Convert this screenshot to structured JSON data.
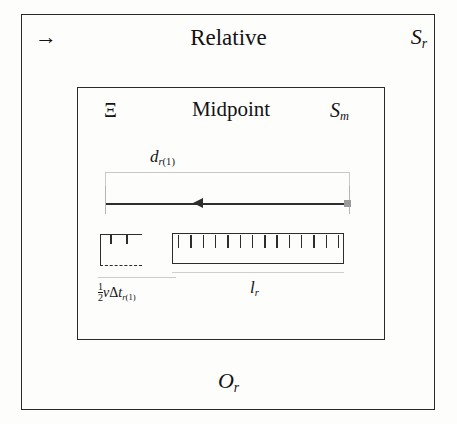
{
  "diagram": {
    "outer_frame": {
      "name": "Relative frame",
      "title": "Relative",
      "corner_label": "S",
      "corner_sub": "r",
      "direction_icon": "→",
      "bottom_label": "O",
      "bottom_sub": "r"
    },
    "inner_frame": {
      "name": "Midpoint frame",
      "title": "Midpoint",
      "corner_label": "S",
      "corner_sub": "m",
      "symbol": "Ξ"
    },
    "measures": {
      "distance": {
        "label": "d",
        "sub": "r",
        "sub_index": "(1)",
        "arrow_direction": "left"
      },
      "light_path": {
        "fraction_numerator": "1",
        "fraction_denominator": "2",
        "nu": "ν",
        "delta": "Δ",
        "t": "t",
        "sub": "r",
        "sub_index": "(1)"
      },
      "rod": {
        "label": "l",
        "sub": "r",
        "tick_count": 14
      }
    }
  },
  "colors": {
    "ink": "#2a2a2a",
    "guide": "#c9c9c9",
    "marker": "#9a9a9a",
    "paper": "#fdfdfc"
  }
}
